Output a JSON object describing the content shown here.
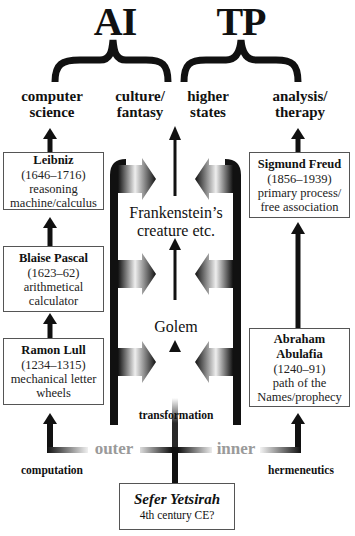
{
  "groups": {
    "left": {
      "label": "AI"
    },
    "right": {
      "label": "TP"
    }
  },
  "categories": [
    {
      "id": "computer-science",
      "lines": [
        "computer",
        "science"
      ]
    },
    {
      "id": "culture-fantasy",
      "lines": [
        "culture/",
        "fantasy"
      ]
    },
    {
      "id": "higher-states",
      "lines": [
        "higher",
        "states"
      ]
    },
    {
      "id": "analysis-therapy",
      "lines": [
        "analysis/",
        "therapy"
      ]
    }
  ],
  "left_column": [
    {
      "name": "Leibniz",
      "dates": "(1646–1716)",
      "desc": [
        "reasoning",
        "machine/calculus"
      ]
    },
    {
      "name": "Blaise Pascal",
      "dates": "(1623–62)",
      "desc": [
        "arithmetical",
        "calculator"
      ]
    },
    {
      "name": "Ramon Lull",
      "dates": "(1234–1315)",
      "desc": [
        "mechanical letter",
        "wheels"
      ]
    }
  ],
  "right_column": [
    {
      "name": "Sigmund Freud",
      "dates": "(1856–1939)",
      "desc": [
        "primary process/",
        "free association"
      ]
    },
    {
      "name_lines": [
        "Abraham",
        "Abulafia"
      ],
      "dates": "(1240–91)",
      "desc": [
        "path of the",
        "Names/prophecy"
      ]
    }
  ],
  "center": {
    "upper": [
      "Frankenstein’s",
      "creature etc."
    ],
    "lower": "Golem",
    "transformation": "transformation"
  },
  "branches": {
    "outer": "outer",
    "inner": "inner",
    "computation": "computation",
    "hermeneutics": "hermeneutics"
  },
  "root": {
    "title": "Sefer Yetsirah",
    "subtitle": "4th century CE?"
  },
  "colors": {
    "ink": "#111111",
    "box_border": "#555555",
    "faded_label": "#9a9a9a",
    "background": "#ffffff"
  }
}
